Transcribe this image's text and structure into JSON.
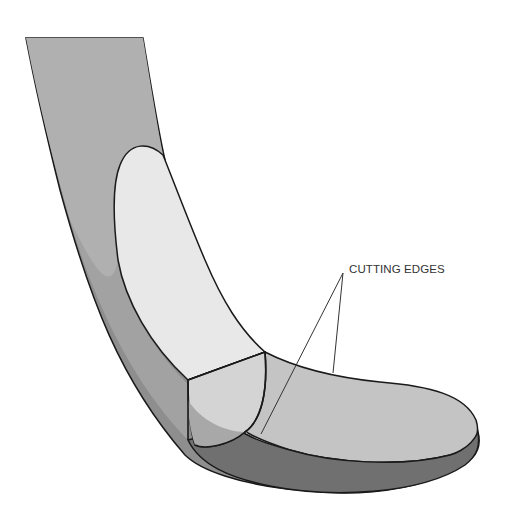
{
  "diagram": {
    "labels": [
      {
        "id": "cutting-edges",
        "text": "CUTTING EDGES",
        "x": 349,
        "y": 263
      }
    ],
    "colors": {
      "shank_face": "#b3b3b3",
      "side_face": "#8e8e8e",
      "front_face": "#e6e6e6",
      "tip_top": "#c4c4c4",
      "tip_side": "#6e6e6e",
      "outline": "#1a1a1a"
    }
  }
}
